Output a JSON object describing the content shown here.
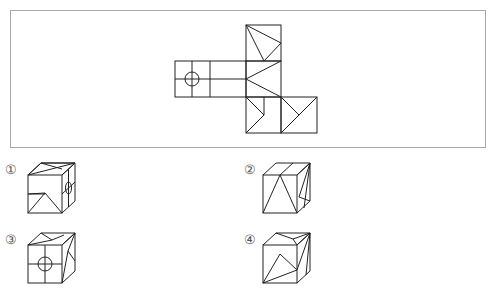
{
  "question": {
    "type": "cube-net-folding",
    "net_frame": {
      "border_color": "#aaaaaa"
    },
    "line_color": "#222222"
  },
  "options": [
    {
      "label": "①",
      "id": 1
    },
    {
      "label": "②",
      "id": 2
    },
    {
      "label": "③",
      "id": 3
    },
    {
      "label": "④",
      "id": 4
    }
  ]
}
